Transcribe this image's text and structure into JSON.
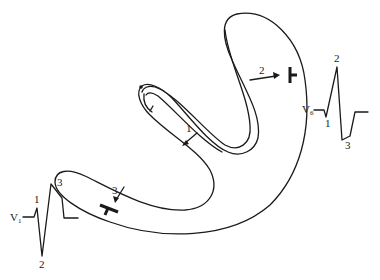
{
  "diagram": {
    "type": "cardiac conduction / ECG illustration",
    "vectors": [
      {
        "id": "1",
        "label": "1"
      },
      {
        "id": "2",
        "label": "2"
      },
      {
        "id": "3",
        "label": "3"
      }
    ],
    "leads": [
      {
        "name": "V",
        "subscript": "1",
        "deflection_labels": [
          "1",
          "2",
          "3"
        ]
      },
      {
        "name": "V",
        "subscript": "6",
        "deflection_labels": [
          "1",
          "2",
          "3"
        ]
      }
    ],
    "colors": {
      "stroke": "#1a1a1a",
      "background": "#ffffff"
    }
  }
}
